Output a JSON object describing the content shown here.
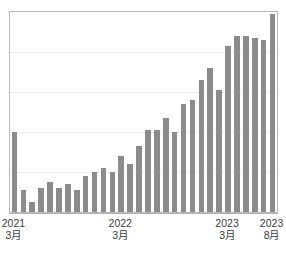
{
  "chart_data": {
    "type": "bar",
    "title": "",
    "subtitle": "",
    "xlabel": "",
    "ylabel": "",
    "grid": true,
    "legend": null,
    "bar_color": "#8c8c8c",
    "frame_color": "#b9b9b9",
    "gridline_color": "#ededed",
    "ylim": [
      0,
      100
    ],
    "gridline_values": [
      20,
      40,
      60,
      80
    ],
    "categories": [
      "2021-03",
      "2021-04",
      "2021-05",
      "2021-06",
      "2021-07",
      "2021-08",
      "2021-09",
      "2021-10",
      "2021-11",
      "2021-12",
      "2022-01",
      "2022-02",
      "2022-03",
      "2022-04",
      "2022-05",
      "2022-06",
      "2022-07",
      "2022-08",
      "2022-09",
      "2022-10",
      "2022-11",
      "2022-12",
      "2023-01",
      "2023-02",
      "2023-03",
      "2023-04",
      "2023-05",
      "2023-06",
      "2023-07",
      "2023-08"
    ],
    "values": [
      40,
      11,
      5,
      12,
      15,
      12,
      14,
      11,
      18,
      20,
      22,
      20,
      28,
      24,
      33,
      41,
      41,
      47,
      40,
      54,
      56,
      66,
      72,
      61,
      83,
      88,
      88,
      87,
      86,
      99
    ],
    "tick_labels": [
      {
        "index": 0,
        "year": "2021",
        "month": "3月"
      },
      {
        "index": 12,
        "year": "2022",
        "month": "3月"
      },
      {
        "index": 24,
        "year": "2023",
        "month": "3月"
      },
      {
        "index": 29,
        "year": "2023",
        "month": "8月"
      }
    ]
  }
}
